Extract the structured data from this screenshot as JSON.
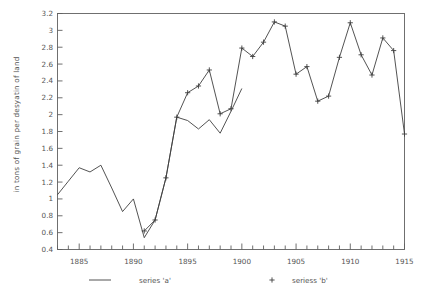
{
  "chart_data": {
    "type": "line",
    "title": "",
    "xlabel": "",
    "ylabel": "in tons of grain per desyatin of land",
    "xlim": [
      1883,
      1915
    ],
    "ylim": [
      0.4,
      3.2
    ],
    "grid": false,
    "legend_position": "bottom",
    "y_ticks": [
      "0.4",
      "0.6",
      "0.8",
      "1",
      "1.2",
      "1.4",
      "1.6",
      "1.8",
      "2",
      "2.2",
      "2.4",
      "2.6",
      "2.8",
      "3",
      "3.2"
    ],
    "y_tick_values": [
      0.4,
      0.6,
      0.8,
      1.0,
      1.2,
      1.4,
      1.6,
      1.8,
      2.0,
      2.2,
      2.4,
      2.6,
      2.8,
      3.0,
      3.2
    ],
    "x_ticks": [
      "1885",
      "1890",
      "1895",
      "1900",
      "1905",
      "1910",
      "1915"
    ],
    "x_tick_values": [
      1885,
      1890,
      1895,
      1900,
      1905,
      1910,
      1915
    ],
    "x_minor_step": 1,
    "series": [
      {
        "name": "series 'a'",
        "marker": "none",
        "line": "solid",
        "color": "#404040",
        "x": [
          1883,
          1884,
          1885,
          1886,
          1887,
          1888,
          1889,
          1890,
          1891,
          1892,
          1893,
          1894,
          1895,
          1896,
          1897,
          1898,
          1899,
          1900
        ],
        "values": [
          1.05,
          1.21,
          1.37,
          1.32,
          1.4,
          1.13,
          0.85,
          1.0,
          0.54,
          0.75,
          1.25,
          1.97,
          1.93,
          1.83,
          1.94,
          1.78,
          2.04,
          2.31
        ]
      },
      {
        "name": "seriess 'b'",
        "marker": "+",
        "line": "solid",
        "color": "#404040",
        "x": [
          1891,
          1892,
          1893,
          1894,
          1895,
          1896,
          1897,
          1898,
          1899,
          1900,
          1901,
          1902,
          1903,
          1904,
          1905,
          1906,
          1907,
          1908,
          1909,
          1910,
          1911,
          1912,
          1913,
          1914,
          1915
        ],
        "values": [
          0.62,
          0.75,
          1.25,
          1.97,
          2.26,
          2.34,
          2.53,
          2.01,
          2.07,
          2.79,
          2.69,
          2.86,
          3.1,
          3.05,
          2.48,
          2.57,
          2.16,
          2.22,
          2.68,
          3.09,
          2.71,
          2.47,
          2.91,
          2.76,
          1.77
        ]
      }
    ]
  },
  "legend": {
    "entries": [
      {
        "label": "series 'a'",
        "marker": "line"
      },
      {
        "label": "seriess 'b'",
        "marker": "plus"
      }
    ]
  }
}
